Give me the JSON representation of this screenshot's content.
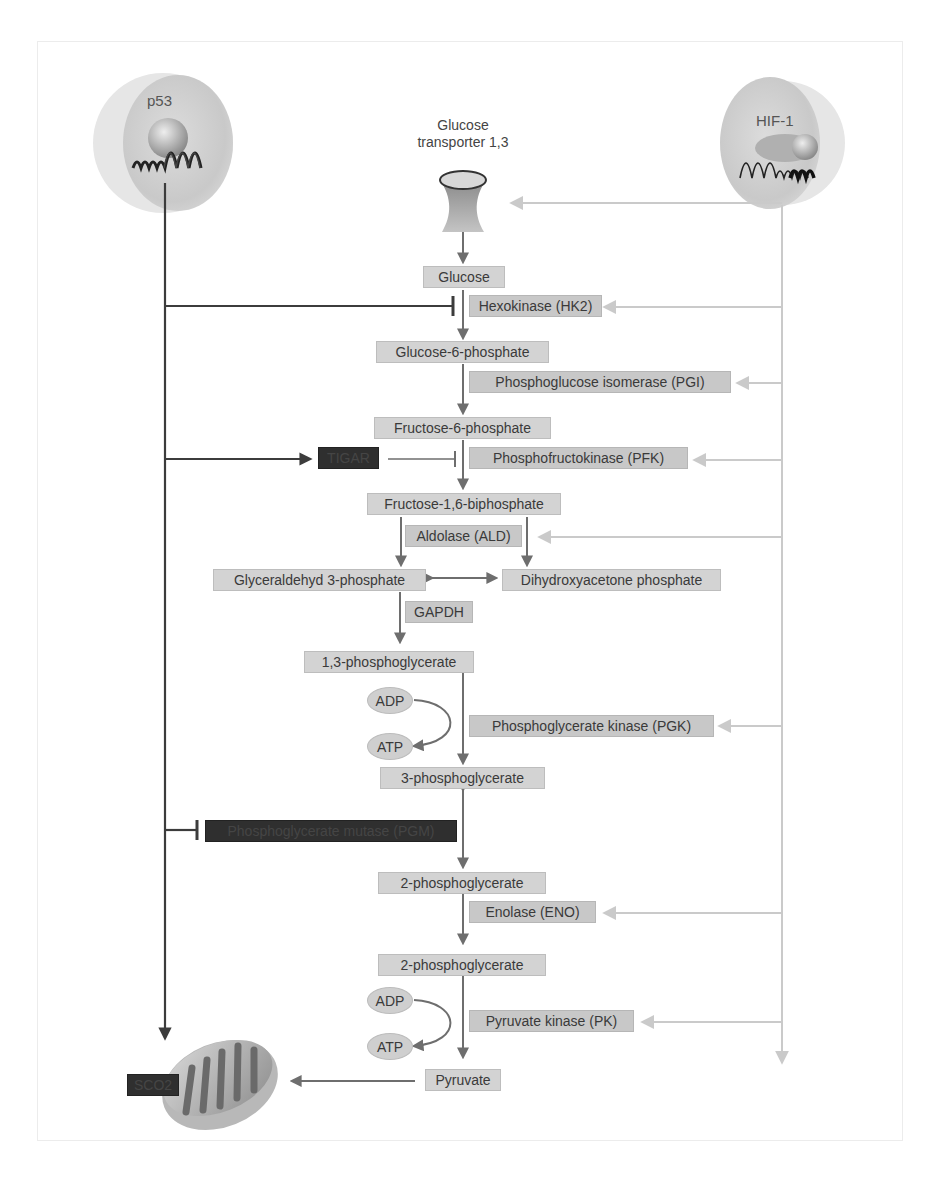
{
  "regulators": {
    "p53": {
      "label": "p53"
    },
    "hif1": {
      "label": "HIF-1"
    }
  },
  "transporter": {
    "label_line1": "Glucose",
    "label_line2": "transporter 1,3"
  },
  "metabolites": {
    "glucose": "Glucose",
    "g6p": "Glucose-6-phosphate",
    "f6p": "Fructose-6-phosphate",
    "f16bp": "Fructose-1,6-biphosphate",
    "g3p": "Glyceraldehyd 3-phosphate",
    "dhap": "Dihydroxyacetone phosphate",
    "bpg13": "1,3-phosphoglycerate",
    "pg3": "3-phosphoglycerate",
    "pg2a": "2-phosphoglycerate",
    "pg2b": "2-phosphoglycerate",
    "pyruvate": "Pyruvate"
  },
  "enzymes": {
    "hk2": "Hexokinase (HK2)",
    "pgi": "Phosphoglucose isomerase (PGI)",
    "pfk": "Phosphofructokinase (PFK)",
    "ald": "Aldolase (ALD)",
    "gapdh": "GAPDH",
    "pgk": "Phosphoglycerate kinase (PGK)",
    "pgm": "Phosphoglycerate mutase (PGM)",
    "eno": "Enolase (ENO)",
    "pk": "Pyruvate kinase (PK)"
  },
  "p53_targets": {
    "tigar": "TIGAR",
    "sco2": "SCO2"
  },
  "cofactors": {
    "adp1": "ADP",
    "atp1": "ATP",
    "adp2": "ADP",
    "atp2": "ATP"
  },
  "colors": {
    "p53_line": "#4a4a4a",
    "pathway_arrow": "#6e6e6e",
    "hif_line": "#c8c8c8",
    "box_fill": "#d3d3d3",
    "dark_box": "#2f2f2f"
  }
}
